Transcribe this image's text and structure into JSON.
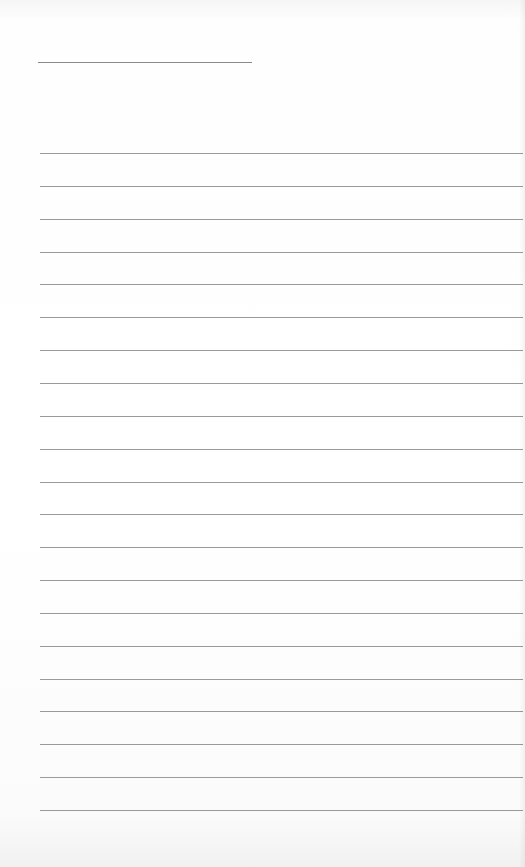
{
  "paper": {
    "type": "lined-notebook-page",
    "title_line": {
      "x": 38,
      "y": 62,
      "width": 214
    },
    "rules": {
      "count": 21,
      "first_y": 153,
      "spacing": 32.85,
      "left": 40
    },
    "colors": {
      "background": "#fdfdfd",
      "rule": "#9a9a9a"
    }
  }
}
